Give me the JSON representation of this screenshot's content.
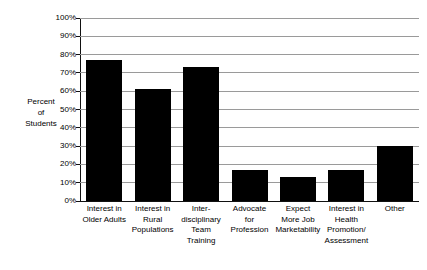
{
  "chart_data": {
    "type": "bar",
    "title": "",
    "xlabel": "",
    "ylabel": "Percent of Students",
    "ylabel_lines": [
      "Percent",
      "of",
      "Students"
    ],
    "categories": [
      "Interest in Older Adults",
      "Interest in Rural Populations",
      "Inter-disciplinary Team Training",
      "Advocate for Profession",
      "Expect More Job Marketability",
      "Interest in Health Promotion/ Assessment",
      "Other"
    ],
    "category_lines": [
      [
        "Interest in",
        "Older Adults"
      ],
      [
        "Interest in",
        "Rural",
        "Populations"
      ],
      [
        "Inter-",
        "disciplinary",
        "Team",
        "Training"
      ],
      [
        "Advocate",
        "for",
        "Profession"
      ],
      [
        "Expect",
        "More Job",
        "Marketability"
      ],
      [
        "Interest in",
        "Health",
        "Promotion/",
        "Assessment"
      ],
      [
        "Other"
      ]
    ],
    "values": [
      77,
      61,
      73,
      17,
      13,
      17,
      30
    ],
    "value_labels": [
      "77%",
      "61%",
      "73%",
      "17%",
      "13%",
      "17%",
      "30%"
    ],
    "ylim": [
      0,
      100
    ],
    "ytick_values": [
      0,
      10,
      20,
      30,
      40,
      50,
      60,
      70,
      80,
      90,
      100
    ],
    "ytick_labels": [
      "0%",
      "10%",
      "20%",
      "30%",
      "40%",
      "50%",
      "60%",
      "70%",
      "80%",
      "90%",
      "100%"
    ],
    "grid": true,
    "legend": null,
    "bar_color": "#000000",
    "gridline_color": "#9a9a9a",
    "axis_color": "#111111"
  }
}
